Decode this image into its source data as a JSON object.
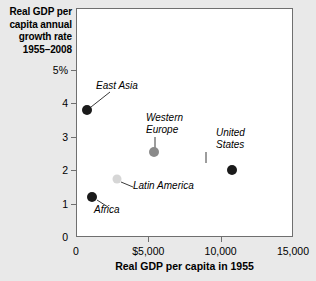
{
  "chart_data": {
    "type": "scatter",
    "ylabel": "Real GDP per\ncapita annual\ngrowth rate\n1955–2008",
    "xlabel": "Real GDP per capita in 1955",
    "xlim": [
      0,
      15000
    ],
    "ylim": [
      0,
      5
    ],
    "grid": false,
    "legend": "none",
    "x_ticks": [
      {
        "value": 0,
        "label": "0"
      },
      {
        "value": 5000,
        "label": "$5,000"
      },
      {
        "value": 10000,
        "label": "10,000"
      },
      {
        "value": 15000,
        "label": "15,000"
      }
    ],
    "y_ticks": [
      {
        "value": 0,
        "label": "0"
      },
      {
        "value": 1,
        "label": "1"
      },
      {
        "value": 2,
        "label": "2"
      },
      {
        "value": 3,
        "label": "3"
      },
      {
        "value": 4,
        "label": "4"
      },
      {
        "value": 5,
        "label": "5%"
      }
    ],
    "points": [
      {
        "name": "East Asia",
        "x": 760,
        "y": 3.8,
        "color": "#1a1a1a",
        "radius": 5.0,
        "label": "East Asia",
        "label_x": 96,
        "label_y": 80,
        "label_align": "left",
        "leader": [
          [
            110,
            92
          ],
          [
            91,
            107
          ]
        ]
      },
      {
        "name": "Africa",
        "x": 1090,
        "y": 1.2,
        "color": "#1a1a1a",
        "radius": 5.0,
        "label": "Africa",
        "label_x": 94,
        "label_y": 204,
        "label_align": "left",
        "leader": [
          [
            97,
            200
          ],
          [
            108,
            207
          ]
        ]
      },
      {
        "name": "Latin America",
        "x": 2840,
        "y": 1.73,
        "color": "#d6d6d6",
        "radius": 4.5,
        "label": "Latin America",
        "label_x": 133,
        "label_y": 180,
        "label_align": "left",
        "leader": [
          [
            121,
            182
          ],
          [
            133,
            187
          ]
        ]
      },
      {
        "name": "Western Europe",
        "x": 5420,
        "y": 2.55,
        "color": "#8a8a8a",
        "radius": 5.0,
        "label": "Western\nEurope",
        "label_x": 146,
        "label_y": 112,
        "label_align": "left",
        "leader": [
          [
            155,
            137
          ],
          [
            155,
            148
          ]
        ]
      },
      {
        "name": "United States",
        "x": 10800,
        "y": 2.0,
        "color": "#1a1a1a",
        "radius": 5.0,
        "label": "United\nStates",
        "label_x": 216,
        "label_y": 127,
        "label_align": "left",
        "leader": [
          [
            206,
            152
          ],
          [
            206,
            163
          ]
        ]
      }
    ],
    "colors": {
      "background": "#e9e9e9",
      "plot_background": "#ffffff",
      "axis": "#6f6f6f",
      "text": "#000000"
    }
  }
}
